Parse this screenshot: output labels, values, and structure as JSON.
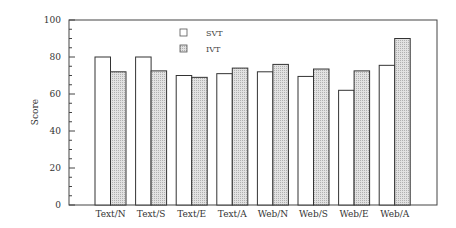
{
  "chart_data": {
    "type": "bar",
    "title": "",
    "xlabel": "",
    "ylabel": "Score",
    "ylim": [
      0,
      100
    ],
    "yticks": [
      0,
      20,
      40,
      60,
      80,
      100
    ],
    "grid": false,
    "legend_position": "top-center-inside",
    "categories": [
      "Text/N",
      "Text/S",
      "Text/E",
      "Text/A",
      "Web/N",
      "Web/S",
      "Web/E",
      "Web/A"
    ],
    "series": [
      {
        "name": "SVT",
        "fill": "#ffffff",
        "values": [
          80,
          80,
          70,
          71,
          72,
          69.5,
          62,
          75.5
        ]
      },
      {
        "name": "IVT",
        "fill": "#d4d4d4",
        "values": [
          72,
          72.5,
          69,
          74,
          76,
          73.5,
          72.5,
          90
        ]
      }
    ]
  },
  "colors": {
    "axis": "#444444",
    "bar_border": "#333333",
    "svt_fill": "#ffffff",
    "ivt_fill": "#d4d4d4"
  }
}
